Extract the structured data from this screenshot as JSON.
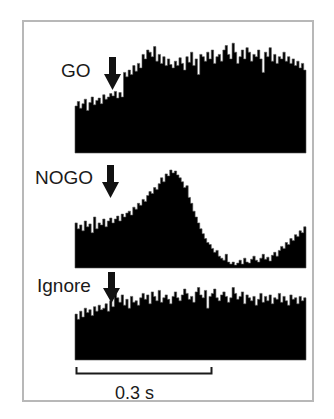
{
  "chart_data": {
    "type": "bar",
    "subtype": "peri-stimulus time histogram (stacked panels)",
    "title": "",
    "xlabel": "time",
    "ylabel": "spike rate (normalized per panel)",
    "grid": false,
    "legend": null,
    "scale_bar": {
      "label": "0.3 s",
      "duration_s": 0.3
    },
    "bins_per_panel": 100,
    "stimulus_marker": "downward arrow at ~bin 17 (stimulus onset)",
    "panels": [
      {
        "name": "GO",
        "label": "GO",
        "arrow_bin": 17,
        "values": [
          0.42,
          0.46,
          0.4,
          0.44,
          0.48,
          0.38,
          0.45,
          0.5,
          0.43,
          0.47,
          0.49,
          0.44,
          0.52,
          0.48,
          0.5,
          0.53,
          0.51,
          0.55,
          0.49,
          0.54,
          0.5,
          0.72,
          0.68,
          0.74,
          0.7,
          0.78,
          0.73,
          0.8,
          0.76,
          0.88,
          0.84,
          0.92,
          0.9,
          0.86,
          0.95,
          0.82,
          0.88,
          0.8,
          0.86,
          0.78,
          0.84,
          0.79,
          0.76,
          0.82,
          0.78,
          0.85,
          0.8,
          0.74,
          0.86,
          0.81,
          0.9,
          0.78,
          0.84,
          0.7,
          0.88,
          0.86,
          0.82,
          0.9,
          0.84,
          0.92,
          0.8,
          0.86,
          0.88,
          0.82,
          0.92,
          0.96,
          0.88,
          0.84,
          0.98,
          0.9,
          0.8,
          0.86,
          0.92,
          0.84,
          0.94,
          0.9,
          0.82,
          0.88,
          0.86,
          0.92,
          0.84,
          0.72,
          0.9,
          0.86,
          0.94,
          0.82,
          0.88,
          0.8,
          0.86,
          0.84,
          0.9,
          0.82,
          0.86,
          0.8,
          0.84,
          0.78,
          0.82,
          0.76,
          0.8,
          0.74
        ]
      },
      {
        "name": "NOGO",
        "label": "NOGO",
        "arrow_bin": 17,
        "values": [
          0.46,
          0.4,
          0.44,
          0.38,
          0.48,
          0.42,
          0.45,
          0.36,
          0.52,
          0.4,
          0.46,
          0.44,
          0.5,
          0.42,
          0.48,
          0.51,
          0.46,
          0.5,
          0.53,
          0.48,
          0.55,
          0.52,
          0.56,
          0.58,
          0.54,
          0.62,
          0.6,
          0.66,
          0.64,
          0.7,
          0.68,
          0.74,
          0.78,
          0.76,
          0.82,
          0.8,
          0.86,
          0.92,
          0.88,
          0.96,
          0.94,
          1.0,
          0.97,
          0.99,
          0.95,
          0.92,
          0.88,
          0.82,
          0.84,
          0.72,
          0.66,
          0.58,
          0.52,
          0.46,
          0.4,
          0.35,
          0.3,
          0.26,
          0.24,
          0.2,
          0.16,
          0.18,
          0.12,
          0.1,
          0.08,
          0.14,
          0.06,
          0.04,
          0.06,
          0.03,
          0.05,
          0.08,
          0.04,
          0.1,
          0.06,
          0.05,
          0.09,
          0.12,
          0.08,
          0.06,
          0.1,
          0.14,
          0.09,
          0.11,
          0.07,
          0.13,
          0.16,
          0.12,
          0.18,
          0.22,
          0.2,
          0.26,
          0.24,
          0.3,
          0.28,
          0.34,
          0.32,
          0.38,
          0.36,
          0.42
        ]
      },
      {
        "name": "Ignore",
        "label": "Ignore",
        "arrow_bin": 17,
        "values": [
          0.62,
          0.55,
          0.66,
          0.58,
          0.7,
          0.64,
          0.68,
          0.6,
          0.72,
          0.66,
          0.74,
          0.68,
          0.7,
          0.76,
          0.66,
          0.8,
          0.72,
          0.9,
          0.84,
          0.78,
          0.88,
          0.74,
          0.82,
          0.7,
          0.86,
          0.78,
          0.8,
          0.74,
          0.84,
          0.9,
          0.82,
          0.88,
          0.76,
          0.92,
          0.86,
          0.8,
          0.94,
          0.78,
          0.84,
          0.88,
          0.82,
          0.76,
          0.86,
          0.92,
          0.84,
          0.8,
          0.88,
          0.96,
          0.9,
          0.82,
          0.86,
          0.78,
          0.92,
          0.98,
          0.88,
          0.84,
          0.94,
          0.7,
          0.86,
          0.9,
          0.96,
          0.84,
          0.8,
          0.88,
          0.92,
          0.86,
          0.78,
          0.84,
          0.98,
          0.9,
          0.82,
          0.86,
          0.92,
          0.76,
          0.88,
          0.84,
          0.8,
          0.86,
          0.74,
          0.82,
          0.9,
          0.78,
          0.86,
          0.8,
          0.88,
          0.76,
          0.84,
          0.82,
          0.9,
          0.78,
          0.86,
          0.8,
          0.74,
          0.88,
          0.82,
          0.84,
          0.76,
          0.86,
          0.8,
          0.84
        ]
      }
    ]
  },
  "labels": {
    "go": "GO",
    "nogo": "NOGO",
    "ignore": "Ignore",
    "scale_bar": "0.3 s"
  },
  "colors": {
    "bars": "#000000",
    "frame": "#b8b8b8",
    "text": "#1a1a1a",
    "background": "#ffffff"
  }
}
